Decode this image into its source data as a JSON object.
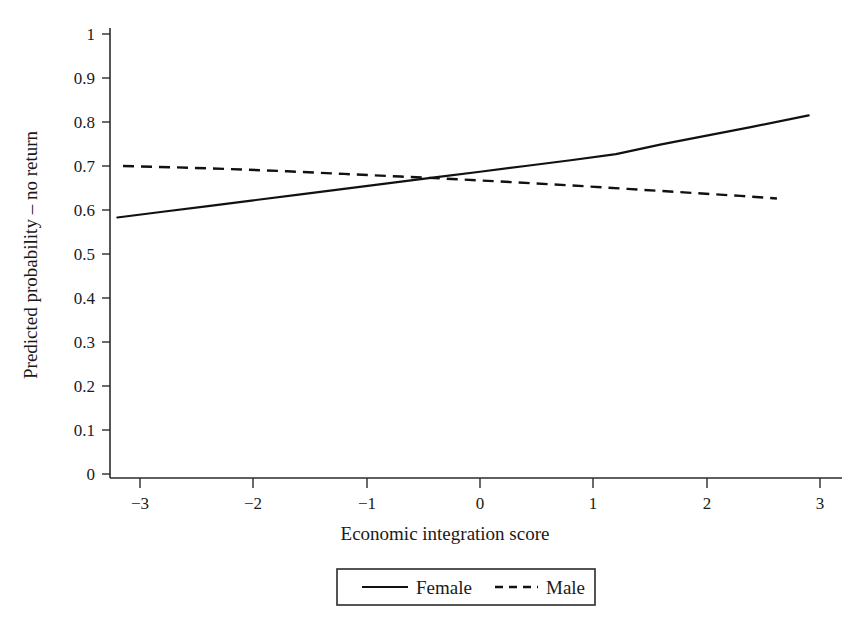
{
  "chart_data": {
    "type": "line",
    "title": "",
    "subtitle": "",
    "xlabel": "Economic integration score",
    "ylabel": "Predicted probability – no return",
    "xlim": [
      -3.2,
      3.2
    ],
    "ylim": [
      0,
      1
    ],
    "grid": false,
    "legend_position": "bottom-center",
    "xticks": [
      -3,
      -2,
      -1,
      0,
      1,
      2,
      3
    ],
    "xtick_labels": [
      "−3",
      "−2",
      "−1",
      "0",
      "1",
      "2",
      "3"
    ],
    "yticks": [
      0,
      0.1,
      0.2,
      0.3,
      0.4,
      0.5,
      0.6,
      0.7,
      0.8,
      0.9,
      1
    ],
    "ytick_labels": [
      "0",
      "0.1",
      "0.2",
      "0.3",
      "0.4",
      "0.5",
      "0.6",
      "0.7",
      "0.8",
      "0.9",
      "1"
    ],
    "series": [
      {
        "name": "Female",
        "style": "solid",
        "color": "#111111",
        "x": [
          -3.2,
          -2.8,
          -2.4,
          -2.0,
          -1.6,
          -1.2,
          -0.8,
          -0.4,
          0.0,
          0.4,
          0.8,
          1.2,
          1.6,
          2.0,
          2.4,
          2.9
        ],
        "y": [
          0.583,
          0.596,
          0.609,
          0.622,
          0.635,
          0.648,
          0.661,
          0.674,
          0.687,
          0.7,
          0.713,
          0.727,
          0.749,
          0.769,
          0.789,
          0.815
        ]
      },
      {
        "name": "Male",
        "style": "dashed",
        "color": "#111111",
        "x": [
          -3.15,
          -2.7,
          -2.2,
          -1.7,
          -1.2,
          -0.7,
          -0.2,
          0.3,
          0.8,
          1.3,
          1.8,
          2.3,
          2.62
        ],
        "y": [
          0.7,
          0.697,
          0.693,
          0.688,
          0.682,
          0.676,
          0.67,
          0.663,
          0.656,
          0.648,
          0.64,
          0.632,
          0.626
        ]
      }
    ],
    "annotations": []
  },
  "legend": {
    "entries": [
      {
        "label": "Female",
        "style": "solid"
      },
      {
        "label": "Male",
        "style": "dashed"
      }
    ]
  }
}
